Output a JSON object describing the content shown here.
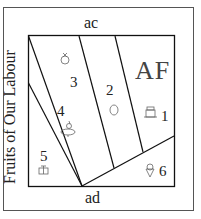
{
  "diagram": {
    "top_label": "ac",
    "bottom_label": "ad",
    "side_label": "Fruits of Our Labour",
    "corner_label": "AF",
    "regions": [
      {
        "number": "1",
        "icon": "cake-icon"
      },
      {
        "number": "2",
        "icon": "lemon-icon"
      },
      {
        "number": "3",
        "icon": "apple-icon"
      },
      {
        "number": "4",
        "icon": "pear-icon"
      },
      {
        "number": "5",
        "icon": "gift-icon"
      },
      {
        "number": "6",
        "icon": "ice-cream-icon"
      }
    ],
    "colors": {
      "line": "#111111",
      "frame": "#555555",
      "text": "#222222"
    }
  }
}
